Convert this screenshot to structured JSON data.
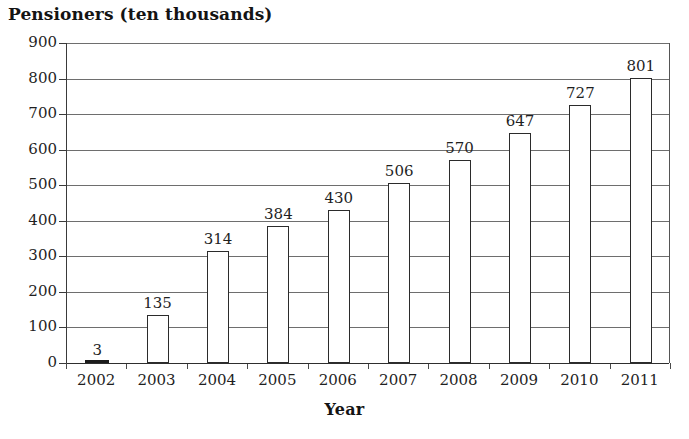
{
  "chart_data": {
    "type": "bar",
    "title": "Pensioners (ten thousands)",
    "xlabel": "Year",
    "ylabel": "",
    "categories": [
      "2002",
      "2003",
      "2004",
      "2005",
      "2006",
      "2007",
      "2008",
      "2009",
      "2010",
      "2011"
    ],
    "values": [
      3,
      135,
      314,
      384,
      430,
      506,
      570,
      647,
      727,
      801
    ],
    "value_labels": [
      "3",
      "135",
      "314",
      "384",
      "430",
      "506",
      "570",
      "647",
      "727",
      "801"
    ],
    "ylim": [
      0,
      900
    ],
    "ytick_labels": [
      "0",
      "100",
      "200",
      "300",
      "400",
      "500",
      "600",
      "700",
      "800",
      "900"
    ],
    "ytick_values": [
      0,
      100,
      200,
      300,
      400,
      500,
      600,
      700,
      800,
      900
    ],
    "ystep": 100,
    "grid": true,
    "legend": "none",
    "bar_fill_color": "#ffffff",
    "bar_edge_color": "#2b2b2b",
    "gridline_color": "#6e6e6e",
    "axis_color": "#2e2e2e",
    "text_color": "#1f1f1f",
    "background_color": "#ffffff"
  }
}
